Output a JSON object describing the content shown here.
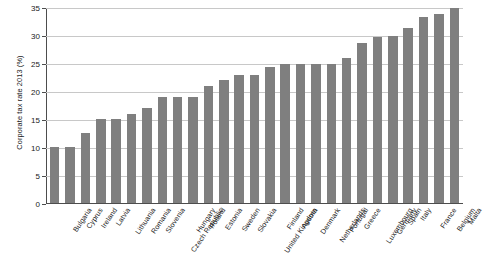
{
  "chart_data": {
    "type": "bar",
    "title": "",
    "xlabel": "",
    "ylabel": "Corporate tax rate 2013 (%)",
    "ylim": [
      0,
      35
    ],
    "yticks": [
      0,
      5,
      10,
      15,
      20,
      25,
      30,
      35
    ],
    "grid": true,
    "legend": "none",
    "bar_color": "#7f7f7f",
    "categories": [
      "Bulgaria",
      "Cyprus",
      "Ireland",
      "Latvia",
      "Lithuania",
      "Romania",
      "Slovenia",
      "Czech Republic",
      "Hungary",
      "Poland",
      "Estonia",
      "Sweden",
      "Slovakia",
      "United Kingdom",
      "Finland",
      "Austria",
      "Denmark",
      "Netherlands",
      "Portugal",
      "Greece",
      "Luxembourg",
      "Germany",
      "Spain",
      "Italy",
      "France",
      "Belgium",
      "Malta"
    ],
    "values": [
      10,
      10,
      12.5,
      15,
      15,
      16,
      17,
      19,
      19,
      19,
      21,
      22,
      23,
      23,
      24.5,
      25,
      25,
      25,
      25,
      26,
      28.8,
      29.8,
      30,
      31.4,
      33.3,
      34,
      35
    ]
  }
}
